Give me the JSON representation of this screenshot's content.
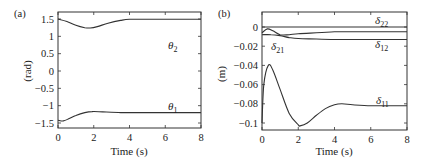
{
  "chart_data": [
    {
      "panel": "(a)",
      "type": "line",
      "title": "",
      "xlabel": "Time (s)",
      "ylabel": "(rad)",
      "xlim": [
        0,
        8
      ],
      "ylim": [
        -1.65,
        1.7
      ],
      "xticks": [
        "0",
        "2",
        "4",
        "6",
        "8"
      ],
      "yticks": [
        "1.5",
        "1",
        "0.5",
        "0",
        "−0.5",
        "−1",
        "−1.5"
      ],
      "grid": false,
      "legend": "inline labels",
      "series": [
        {
          "name": "θ2",
          "symbol": "θ",
          "sub": "2",
          "x": [
            0,
            0.5,
            1.0,
            1.5,
            1.8,
            2.2,
            2.8,
            3.5,
            4.0,
            5,
            6,
            7,
            8
          ],
          "values": [
            1.5,
            1.43,
            1.32,
            1.25,
            1.24,
            1.28,
            1.38,
            1.46,
            1.49,
            1.49,
            1.49,
            1.49,
            1.49
          ]
        },
        {
          "name": "θ1",
          "symbol": "θ",
          "sub": "1",
          "x": [
            0,
            0.3,
            0.6,
            1.0,
            1.5,
            1.9,
            2.5,
            3.5,
            4,
            5,
            6,
            7,
            8
          ],
          "values": [
            -1.42,
            -1.44,
            -1.38,
            -1.28,
            -1.2,
            -1.17,
            -1.18,
            -1.2,
            -1.2,
            -1.2,
            -1.2,
            -1.2,
            -1.2
          ]
        }
      ]
    },
    {
      "panel": "(b)",
      "type": "line",
      "title": "",
      "xlabel": "Time (s)",
      "ylabel": "(m)",
      "xlim": [
        0,
        8
      ],
      "ylim": [
        -0.11,
        0.0155
      ],
      "xticks": [
        "0",
        "2",
        "4",
        "6",
        "8"
      ],
      "yticks": [
        "0",
        "−0.02",
        "−0.04",
        "−0.06",
        "−0.08",
        "−0.1"
      ],
      "grid": false,
      "legend": "inline labels",
      "series": [
        {
          "name": "δ22",
          "symbol": "δ",
          "sub": "22",
          "x": [
            0,
            2,
            4,
            6,
            8
          ],
          "values": [
            0.0,
            0.0,
            0.0,
            0.0,
            0.0
          ]
        },
        {
          "name": "δ21",
          "symbol": "δ",
          "sub": "21",
          "x": [
            0,
            0.3,
            0.6,
            1.0,
            1.5,
            2.0,
            3.0,
            4.0,
            5,
            6,
            8
          ],
          "values": [
            -0.006,
            -0.002,
            -0.004,
            -0.008,
            -0.008,
            -0.007,
            -0.006,
            -0.005,
            -0.005,
            -0.005,
            -0.005
          ]
        },
        {
          "name": "δ12",
          "symbol": "δ",
          "sub": "12",
          "x": [
            0,
            0.5,
            1.0,
            1.5,
            2.0,
            3.0,
            4.0,
            5,
            6,
            8
          ],
          "values": [
            -0.008,
            -0.008,
            -0.009,
            -0.011,
            -0.012,
            -0.0125,
            -0.013,
            -0.013,
            -0.013,
            -0.013
          ]
        },
        {
          "name": "δ11",
          "symbol": "δ",
          "sub": "11",
          "x": [
            0,
            0.1,
            0.35,
            0.6,
            1.0,
            1.5,
            2.0,
            2.1,
            2.5,
            3.0,
            3.5,
            4.0,
            4.4,
            5,
            6,
            7,
            8
          ],
          "values": [
            -0.1,
            -0.06,
            -0.04,
            -0.045,
            -0.065,
            -0.09,
            -0.102,
            -0.103,
            -0.1,
            -0.092,
            -0.085,
            -0.081,
            -0.08,
            -0.081,
            -0.082,
            -0.082,
            -0.082
          ]
        }
      ]
    }
  ],
  "panels": [
    {
      "label": "(a)",
      "ylabel": "(rad)",
      "xlabel": "Time (s)"
    },
    {
      "label": "(b)",
      "ylabel": "(m)",
      "xlabel": "Time (s)"
    }
  ]
}
